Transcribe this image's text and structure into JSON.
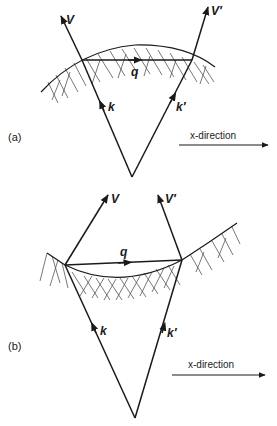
{
  "figure": {
    "panels": [
      {
        "id": "a",
        "label": "(a)",
        "vectors": {
          "V": "V",
          "V_prime": "V′",
          "k": "k",
          "k_prime": "k′",
          "q": "q"
        },
        "direction_label": "x-direction"
      },
      {
        "id": "b",
        "label": "(b)",
        "vectors": {
          "V": "V",
          "V_prime": "V′",
          "k": "k",
          "k_prime": "k′",
          "q": "q"
        },
        "direction_label": "x-direction"
      }
    ]
  }
}
